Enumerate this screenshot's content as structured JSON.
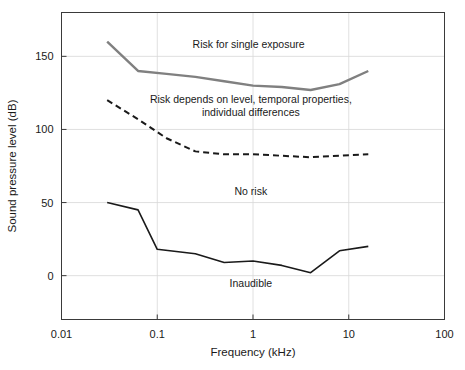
{
  "chart_data": {
    "type": "line",
    "title": "",
    "xlabel": "Frequency (kHz)",
    "ylabel": "Sound pressure level (dB)",
    "xscale": "log",
    "xlim": [
      0.01,
      100
    ],
    "ylim": [
      -30,
      180
    ],
    "grid": true,
    "legend": "none",
    "xticks": [
      "0.01",
      "0.1",
      "1",
      "10",
      "100"
    ],
    "xtick_values": [
      0.01,
      0.1,
      1,
      10,
      100
    ],
    "yticks": [
      "0",
      "50",
      "100",
      "150"
    ],
    "ytick_values": [
      0,
      50,
      100,
      150
    ],
    "series": [
      {
        "name": "Risk for single exposure boundary",
        "style": "solid",
        "color": "#808080",
        "width": 2.4,
        "x": [
          0.03,
          0.063,
          0.125,
          0.25,
          0.5,
          1,
          2,
          4,
          8,
          16
        ],
        "values": [
          160,
          140,
          138,
          136,
          133,
          130,
          129,
          127,
          131,
          140
        ]
      },
      {
        "name": "Risk depends on level boundary",
        "style": "dashed",
        "color": "#1a1a1a",
        "width": 2.0,
        "x": [
          0.03,
          0.063,
          0.125,
          0.25,
          0.5,
          1,
          2,
          4,
          8,
          16
        ],
        "values": [
          120,
          107,
          94,
          85,
          83,
          83,
          82,
          81,
          82,
          83
        ]
      },
      {
        "name": "Threshold of audibility",
        "style": "solid",
        "color": "#1a1a1a",
        "width": 1.6,
        "x": [
          0.03,
          0.063,
          0.1,
          0.25,
          0.5,
          1,
          2,
          4,
          8,
          16
        ],
        "values": [
          50,
          45,
          18,
          15,
          9,
          10,
          7,
          2,
          17,
          20
        ]
      }
    ],
    "annotations": [
      {
        "id": "risk-single-exposure",
        "lines": [
          "Risk for single exposure"
        ],
        "x": 0.9,
        "y": 156,
        "anchor": "middle"
      },
      {
        "id": "risk-depends",
        "lines": [
          "Risk depends on level, temporal properties,",
          "individual differences"
        ],
        "x": 0.95,
        "y": 118,
        "anchor": "middle"
      },
      {
        "id": "no-risk",
        "lines": [
          "No risk"
        ],
        "x": 0.95,
        "y": 55,
        "anchor": "middle"
      },
      {
        "id": "inaudible",
        "lines": [
          "Inaudible"
        ],
        "x": 0.95,
        "y": -8,
        "anchor": "middle"
      }
    ]
  },
  "figure": {
    "background_color": "#ffffff",
    "frame_color": "#3a3a3a",
    "grid_color": "#d8d8d8"
  }
}
